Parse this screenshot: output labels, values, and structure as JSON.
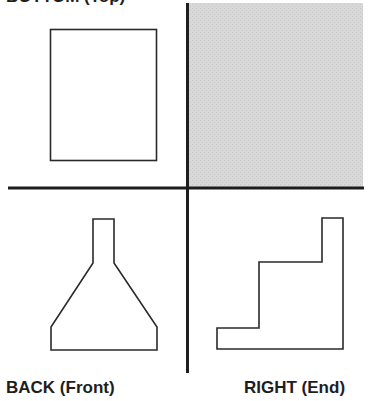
{
  "labels": {
    "top": "BOTTOM (Top)",
    "back": "BACK (Front)",
    "right": "RIGHT (End)"
  },
  "colors": {
    "line": "#1e1e1e",
    "shaded_quadrant": "#d6d6d6",
    "background": "#ffffff"
  },
  "quadrants": {
    "top_left": {
      "view": "top",
      "shape": "rectangle"
    },
    "top_right": {
      "view": "unused",
      "shape": "shaded"
    },
    "bottom_left": {
      "view": "front",
      "shape": "flask-profile"
    },
    "bottom_right": {
      "view": "end",
      "shape": "stair-step-profile"
    }
  }
}
